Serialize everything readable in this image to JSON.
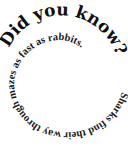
{
  "graphic": {
    "type": "spiral-text",
    "headline": "Did you know?",
    "body": "Sharks find their way through mazes as fast as rabbits.",
    "text_color": "#111111",
    "background": "#ffffff"
  }
}
